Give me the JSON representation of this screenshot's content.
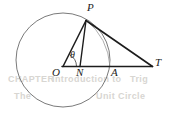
{
  "figure": {
    "kind": "geometry-diagram",
    "caption": "Circle centered at O with radius OP; tangent-like line PT meeting the extended diameter at T",
    "width": 174,
    "height": 119,
    "background_color": "#ffffff",
    "stroke_color": "#1c1c1c",
    "circle_stroke_color": "#595959",
    "arc_stroke_color": "#8a8a8a",
    "ghost_color": "#d8d6d2"
  },
  "circle": {
    "name": "main-circle",
    "center_x": 63,
    "center_y": 60,
    "radius": 47
  },
  "points": {
    "O": {
      "label": "O",
      "x": 63,
      "y": 66.5,
      "label_x": 53,
      "label_y": 68
    },
    "N": {
      "label": "N",
      "x": 80,
      "y": 66.5,
      "label_x": 77,
      "label_y": 68
    },
    "A": {
      "label": "A",
      "x": 110,
      "y": 66.5,
      "label_x": 111,
      "label_y": 68
    },
    "T": {
      "label": "T",
      "x": 152,
      "y": 66.5,
      "label_x": 155,
      "label_y": 58
    },
    "P": {
      "label": "P",
      "x": 86,
      "y": 20,
      "label_x": 87,
      "label_y": 3
    }
  },
  "angle": {
    "label": "θ",
    "symbol_name": "theta",
    "vertex": "O",
    "label_x": 70,
    "label_y": 50
  },
  "segments": [
    {
      "name": "segment-OT",
      "from": "O",
      "to": "T",
      "x1": 63,
      "y1": 66.5,
      "x2": 152,
      "y2": 66.5
    },
    {
      "name": "segment-OP",
      "from": "O",
      "to": "P",
      "x1": 63,
      "y1": 66.5,
      "x2": 86,
      "y2": 20
    },
    {
      "name": "segment-PN",
      "from": "P",
      "to": "N",
      "x1": 86,
      "y1": 20,
      "x2": 80,
      "y2": 66.5
    },
    {
      "name": "segment-PT",
      "from": "P",
      "to": "T",
      "x1": 86,
      "y1": 20,
      "x2": 152,
      "y2": 66.5
    }
  ],
  "arcs": [
    {
      "name": "arc-PA",
      "from": "P",
      "to": "A",
      "description": "faint arc from P sweeping to A"
    },
    {
      "name": "arc-angle-theta",
      "description": "small arc marking the angle theta at O"
    }
  ],
  "ghost_text": [
    {
      "text": "CHAPTER",
      "x": 8,
      "y": 79,
      "size": 9
    },
    {
      "text": "Introduction to",
      "x": 52,
      "y": 79,
      "size": 9
    },
    {
      "text": "Trig",
      "x": 130,
      "y": 79,
      "size": 9
    },
    {
      "text": "The",
      "x": 14,
      "y": 96,
      "size": 9
    },
    {
      "text": "Unit Circle",
      "x": 96,
      "y": 96,
      "size": 9
    }
  ]
}
